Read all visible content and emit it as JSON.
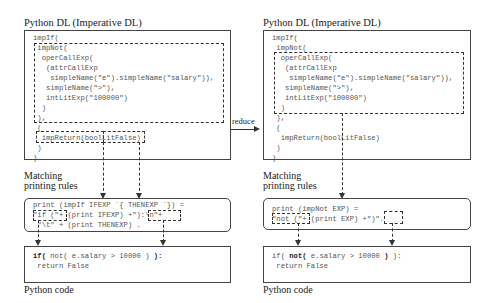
{
  "left": {
    "dl_title": "Python DL (Imperative DL)",
    "dl_code": [
      "impIf(",
      " impNot(",
      "  operCallExp(",
      "   (attrCallExp",
      "    simpleName(\"e\").simpleName(\"salary\")),",
      "   simpleName(\">\"),",
      "   intLitExp(\"100000\")",
      "  )",
      " ),",
      " (",
      "  impReturn(boolLitFalse)",
      " )",
      ")"
    ],
    "rules_label_1": "Matching",
    "rules_label_2": "printing rules",
    "rule_lines": [
      "print (impIf IFEXP `{ THENEXP `}) =",
      "\"if (\"+ (print IFEXP) +\"):\\n\"+",
      " \"\\t\" + (print THENEXP) ."
    ],
    "py_line1_bold_a": "if(",
    "py_line1_mid": " not( e.salary > 10000 ) ",
    "py_line1_bold_b": "):",
    "py_line2": " return False",
    "py_label": "Python code"
  },
  "arrow": {
    "label": "reduce"
  },
  "right": {
    "dl_title": "Python DL (Imperative DL)",
    "dl_code": [
      "impIf(",
      " impNot(",
      "  operCallExp(",
      "   (attrCallExp",
      "    simpleName(\"e\").simpleName(\"salary\")),",
      "   simpleName(\">\"),",
      "   intLitExp(\"100000\")",
      "  )",
      " ),",
      " (",
      "  impReturn(boolLitFalse)",
      " )",
      ")"
    ],
    "rules_label_1": "Matching",
    "rules_label_2": "printing rules",
    "rule_lines": [
      "print (impNot EXP) =",
      "\"not (\"+ (print EXP) +\")\"."
    ],
    "py_line1_a": "if( ",
    "py_line1_bold_a": "not(",
    "py_line1_mid": " e.salary > 10000 ",
    "py_line1_bold_b": ")",
    "py_line1_c": " ):",
    "py_line2": " return False",
    "py_label": "Python code"
  }
}
